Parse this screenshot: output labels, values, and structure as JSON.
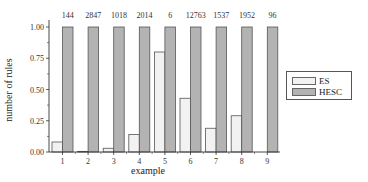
{
  "chart_data": {
    "type": "bar",
    "title": "",
    "xlabel": "example",
    "ylabel": "number of rules",
    "categories": [
      "1",
      "2",
      "3",
      "4",
      "5",
      "6",
      "7",
      "8",
      "9"
    ],
    "top_annotations": [
      "144",
      "2847",
      "1018",
      "2014",
      "6",
      "12763",
      "1537",
      "1952",
      "96"
    ],
    "series": [
      {
        "name": "ES",
        "color": "#f2f2f2",
        "values": [
          0.08,
          0.005,
          0.03,
          0.14,
          0.8,
          0.43,
          0.19,
          0.29,
          0.0
        ]
      },
      {
        "name": "HESC",
        "color": "#b3b3b3",
        "values": [
          1.0,
          1.0,
          1.0,
          1.0,
          1.0,
          1.0,
          1.0,
          1.0,
          1.0
        ]
      }
    ],
    "yticks": [
      "0.00",
      "0.25",
      "0.50",
      "0.75",
      "1.00"
    ],
    "ylim": [
      0,
      1.0
    ],
    "grid": false,
    "legend_position": "right"
  },
  "legend": {
    "items": [
      {
        "label": "ES",
        "color": "#f2f2f2"
      },
      {
        "label": "HESC",
        "color": "#b3b3b3"
      }
    ]
  }
}
